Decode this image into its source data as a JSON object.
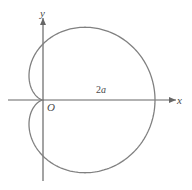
{
  "figure": {
    "background_color": "#ffffff",
    "width": 192,
    "height": 190
  },
  "axes": {
    "x_axis": {
      "label": "x",
      "color": "#666666",
      "y_pixel": 100,
      "x_start": 8,
      "x_end": 176,
      "arrow": "right"
    },
    "y_axis": {
      "label": "y",
      "color": "#666666",
      "x_pixel": 43,
      "y_start": 181,
      "y_end": 18,
      "arrow": "up"
    },
    "origin": {
      "label": "O",
      "x_pixel": 43,
      "y_pixel": 100
    }
  },
  "annotations": [
    {
      "name": "diameter-label",
      "text_number": "2",
      "text_variable": "a",
      "full_text": "2a",
      "x_pixel": 96,
      "y_pixel": 85
    }
  ],
  "chart_data": {
    "type": "line",
    "curve_name": "cardioid",
    "equation_polar": "r = a(1 + cos θ)",
    "xlabel": "x",
    "ylabel": "y",
    "grid": false,
    "legend": null,
    "stroke_color": "#808080",
    "stroke_width": 1.3,
    "fill": "none",
    "parameters": {
      "a_pixels": 56,
      "cusp_x_pixel": 43,
      "cusp_y_pixel": 100,
      "max_x_pixel": 155,
      "min_x_pixel": 27,
      "max_y_pixel_top": 25,
      "max_y_pixel_bottom": 175,
      "theta_start_deg": 0,
      "theta_end_deg": 360,
      "samples": 361
    },
    "key_points": [
      {
        "label": "cusp (origin)",
        "theta_deg": 180,
        "r_over_a": 0.0,
        "x_pixel": 43,
        "y_pixel": 100
      },
      {
        "label": "rightmost vertex (2a)",
        "theta_deg": 0,
        "r_over_a": 2.0,
        "x_pixel": 155,
        "y_pixel": 100
      },
      {
        "label": "top",
        "theta_deg": 90,
        "r_over_a": 1.0,
        "x_pixel": 99,
        "y_pixel": 44
      },
      {
        "label": "bottom",
        "theta_deg": 270,
        "r_over_a": 1.0,
        "x_pixel": 99,
        "y_pixel": 156
      },
      {
        "label": "leftmost extent",
        "theta_deg": 120,
        "r_over_a": 0.5,
        "x_pixel": 27,
        "y_pixel": 76
      }
    ],
    "axis_ranges": {
      "x_data_units": [
        -0.3,
        2.4
      ],
      "y_data_units": [
        -1.35,
        1.35
      ]
    }
  }
}
